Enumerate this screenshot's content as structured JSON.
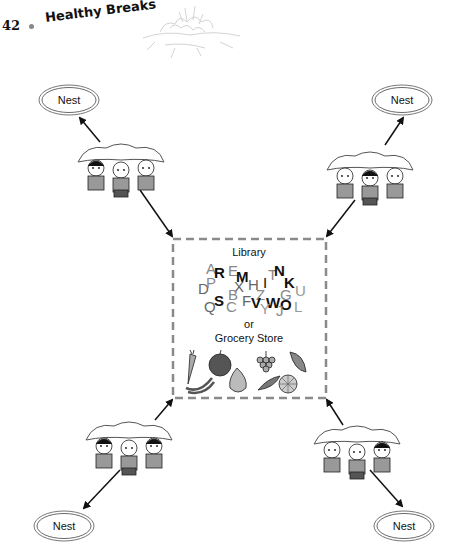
{
  "header": {
    "page_number": "42",
    "book_title": "Healthy Breaks"
  },
  "diagram": {
    "nests": [
      {
        "id": "top-left",
        "label": "Nest"
      },
      {
        "id": "top-right",
        "label": "Nest"
      },
      {
        "id": "bottom-left",
        "label": "Nest"
      },
      {
        "id": "bottom-right",
        "label": "Nest"
      }
    ],
    "center": {
      "title": "Library",
      "connector": "or",
      "subtitle": "Grocery Store",
      "letters": [
        "A",
        "R",
        "E",
        "M",
        "H",
        "I",
        "T",
        "N",
        "K",
        "U",
        "D",
        "P",
        "X",
        "B",
        "Z",
        "G",
        "S",
        "F",
        "V",
        "W",
        "O",
        "Q",
        "C",
        "Y",
        "J",
        "L"
      ],
      "foods": [
        "carrot",
        "apple",
        "grapes",
        "corn",
        "bananas",
        "pear",
        "pea-pod",
        "orange"
      ]
    },
    "groups": [
      {
        "id": "group-top-left",
        "icon": "children-under-parachute-icon"
      },
      {
        "id": "group-top-right",
        "icon": "children-under-parachute-icon"
      },
      {
        "id": "group-bottom-left",
        "icon": "children-under-parachute-icon"
      },
      {
        "id": "group-bottom-right",
        "icon": "children-under-parachute-icon"
      }
    ],
    "colors": {
      "ink": "#111111",
      "letter_gray": "#7a7a7a",
      "dash": "#8a8a8a",
      "nest_ring": "#777777"
    }
  }
}
